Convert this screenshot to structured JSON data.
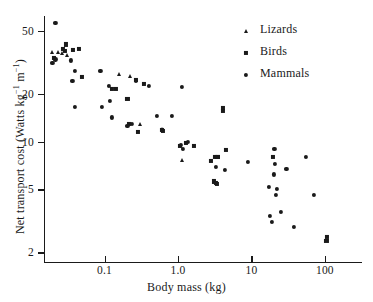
{
  "chart_data": {
    "type": "scatter",
    "title": "",
    "xlabel": "Body mass (kg)",
    "ylabel": "Net transport cost (Watts kg⁻¹ m⁻¹)",
    "xscale": "log",
    "yscale": "log",
    "xlim": [
      0.015,
      320
    ],
    "ylim": [
      1.75,
      62
    ],
    "grid": false,
    "legend_position": "top-right",
    "xticks": [
      {
        "value": 0.1,
        "label": "0.1"
      },
      {
        "value": 1.0,
        "label": "1.0"
      },
      {
        "value": 10,
        "label": "10"
      },
      {
        "value": 100,
        "label": "100"
      }
    ],
    "yticks": [
      {
        "value": 50,
        "label": "50"
      },
      {
        "value": 20,
        "label": "20"
      },
      {
        "value": 10,
        "label": "10"
      },
      {
        "value": 5,
        "label": "5"
      },
      {
        "value": 2,
        "label": "2"
      }
    ],
    "series": [
      {
        "name": "Lizards",
        "marker": "triangle",
        "color": "#1a1a1a",
        "points": [
          [
            0.019,
            37.0
          ],
          [
            0.0235,
            36.5
          ],
          [
            0.026,
            36.0
          ],
          [
            0.031,
            35.0
          ],
          [
            0.155,
            26.5
          ],
          [
            0.225,
            26.0
          ],
          [
            0.3,
            13.0
          ],
          [
            0.6,
            12.0
          ],
          [
            1.15,
            7.6
          ]
        ]
      },
      {
        "name": "Birds",
        "marker": "square",
        "color": "#1a1a1a",
        "points": [
          [
            0.0205,
            33.5
          ],
          [
            0.0275,
            38.5
          ],
          [
            0.029,
            37.5
          ],
          [
            0.0295,
            41.0
          ],
          [
            0.0375,
            38.0
          ],
          [
            0.0455,
            38.5
          ],
          [
            0.0495,
            25.5
          ],
          [
            0.125,
            21.5
          ],
          [
            0.145,
            21.5
          ],
          [
            0.205,
            18.5
          ],
          [
            0.215,
            12.9
          ],
          [
            0.265,
            24.5
          ],
          [
            0.285,
            11.5
          ],
          [
            0.345,
            23.0
          ],
          [
            0.61,
            11.8
          ],
          [
            0.63,
            11.6
          ],
          [
            1.05,
            9.4
          ],
          [
            1.3,
            9.8
          ],
          [
            1.65,
            9.4
          ],
          [
            2.85,
            7.5
          ],
          [
            3.15,
            8.0
          ],
          [
            3.45,
            8.0
          ],
          [
            3.55,
            8.0
          ],
          [
            3.05,
            5.6
          ],
          [
            3.25,
            5.5
          ],
          [
            3.4,
            5.4
          ],
          [
            4.05,
            15.6
          ],
          [
            4.1,
            16.2
          ],
          [
            4.45,
            8.8
          ],
          [
            19.5,
            8.0
          ],
          [
            105,
            2.35
          ],
          [
            108,
            2.5
          ]
        ]
      },
      {
        "name": "Mammals",
        "marker": "circle",
        "color": "#1a1a1a",
        "points": [
          [
            0.0215,
            56.0
          ],
          [
            0.0195,
            31.5
          ],
          [
            0.0215,
            33.0
          ],
          [
            0.0345,
            32.5
          ],
          [
            0.0395,
            28.0
          ],
          [
            0.0365,
            24.0
          ],
          [
            0.0395,
            16.5
          ],
          [
            0.088,
            28.0
          ],
          [
            0.092,
            16.5
          ],
          [
            0.115,
            22.5
          ],
          [
            0.118,
            18.0
          ],
          [
            0.125,
            14.2
          ],
          [
            0.205,
            12.5
          ],
          [
            0.235,
            13.0
          ],
          [
            0.265,
            24.0
          ],
          [
            0.4,
            22.5
          ],
          [
            0.52,
            14.6
          ],
          [
            0.82,
            14.5
          ],
          [
            1.12,
            22.0
          ],
          [
            1.1,
            9.5
          ],
          [
            1.18,
            9.0
          ],
          [
            1.35,
            9.9
          ],
          [
            3.3,
            6.9
          ],
          [
            4.35,
            6.6
          ],
          [
            9.0,
            7.4
          ],
          [
            17.5,
            5.2
          ],
          [
            18.0,
            3.4
          ],
          [
            19.0,
            3.1
          ],
          [
            20.5,
            9.0
          ],
          [
            20.0,
            6.2
          ],
          [
            21.0,
            7.2
          ],
          [
            21.5,
            4.6
          ],
          [
            22.0,
            5.0
          ],
          [
            25.0,
            3.6
          ],
          [
            30.0,
            6.7
          ],
          [
            38.0,
            2.9
          ],
          [
            55.0,
            8.0
          ],
          [
            70.0,
            4.6
          ]
        ]
      }
    ]
  }
}
